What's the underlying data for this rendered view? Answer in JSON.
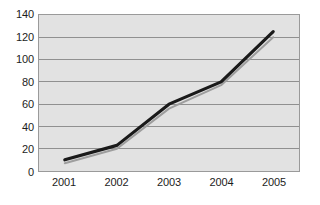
{
  "chart_data": {
    "type": "line",
    "title": "",
    "subtitle": "",
    "xlabel": "",
    "ylabel": "",
    "categories": [
      "2001",
      "2002",
      "2003",
      "2004",
      "2005"
    ],
    "series": [
      {
        "name": "series-1",
        "values": [
          10,
          23,
          60,
          80,
          125
        ],
        "color": "#1a1a1a",
        "width": 3.2
      },
      {
        "name": "series-1-shadow",
        "values": [
          7,
          20,
          56,
          77,
          120
        ],
        "color": "#9e9e9e",
        "width": 2.0
      }
    ],
    "ylim": [
      0,
      140
    ],
    "yticks": [
      0,
      20,
      40,
      60,
      80,
      100,
      120,
      140
    ],
    "ytick_labels": [
      "0",
      "20",
      "40",
      "60",
      "80",
      "100",
      "120",
      "140"
    ],
    "xtick_labels": [
      "2001",
      "2002",
      "2003",
      "2004",
      "2005"
    ],
    "grid": true,
    "grid_axis": "y",
    "legend": false,
    "legend_position": "none",
    "plot_background": "#e2e2e2",
    "page_background": "#ffffff",
    "grid_color": "#8f8f8f",
    "border_color": "#9a9a9a",
    "tick_label_color": "#1c1c1c"
  }
}
